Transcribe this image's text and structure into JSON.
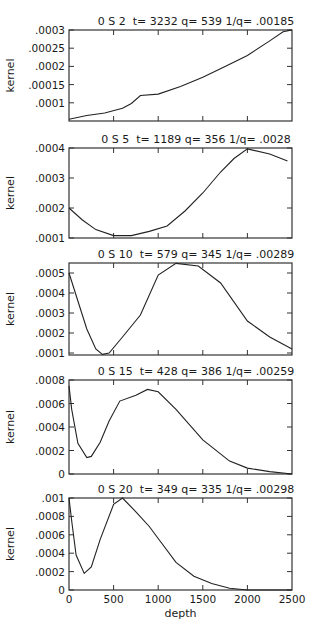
{
  "figure": {
    "xlabel": "depth",
    "ylabel": "kernel"
  },
  "chart_data": [
    {
      "type": "line",
      "title": "0 S 2   t= 3232 q= 539 1/q= .00185",
      "xlabel": "",
      "ylabel": "kernel",
      "xlim": [
        0,
        2500
      ],
      "ylim": [
        5e-05,
        0.0003
      ],
      "yticks": [
        ".0001",
        ".00015",
        ".0002",
        ".00025",
        ".0003"
      ],
      "x": [
        0,
        200,
        400,
        600,
        700,
        800,
        1000,
        1250,
        1500,
        1750,
        2000,
        2250,
        2400,
        2500
      ],
      "values": [
        5.5e-05,
        6.5e-05,
        7.2e-05,
        8.5e-05,
        9.8e-05,
        0.00012,
        0.000124,
        0.000145,
        0.00017,
        0.0002,
        0.00023,
        0.00027,
        0.000295,
        0.0003
      ]
    },
    {
      "type": "line",
      "title": "0 S 5   t= 1189 q= 356 1/q= .0028",
      "xlabel": "",
      "ylabel": "kernel",
      "xlim": [
        0,
        2500
      ],
      "ylim": [
        0.0001,
        0.0004
      ],
      "yticks": [
        ".0001",
        ".0002",
        ".0003",
        ".0004"
      ],
      "x": [
        0,
        150,
        300,
        500,
        700,
        900,
        1100,
        1300,
        1500,
        1700,
        1850,
        2000,
        2250,
        2450
      ],
      "values": [
        0.0002,
        0.00016,
        0.000128,
        0.000108,
        0.000108,
        0.000122,
        0.00014,
        0.00019,
        0.00025,
        0.00032,
        0.000365,
        0.000397,
        0.00038,
        0.000357
      ]
    },
    {
      "type": "line",
      "title": "0 S 10   t= 579 q= 345 1/q= .00289",
      "xlabel": "",
      "ylabel": "kernel",
      "xlim": [
        0,
        2500
      ],
      "ylim": [
        9e-05,
        0.00055
      ],
      "yticks": [
        ".0001",
        ".0002",
        ".0003",
        ".0004",
        ".0005"
      ],
      "x": [
        0,
        100,
        200,
        300,
        375,
        450,
        600,
        800,
        1000,
        1200,
        1450,
        1700,
        2000,
        2250,
        2500
      ],
      "values": [
        0.0005,
        0.00036,
        0.00022,
        0.00012,
        9.3e-05,
        0.0001,
        0.00018,
        0.00029,
        0.00049,
        0.000548,
        0.000535,
        0.00045,
        0.00026,
        0.00018,
        0.00012
      ]
    },
    {
      "type": "line",
      "title": "0 S 15   t= 428 q= 386 1/q= .00259",
      "xlabel": "",
      "ylabel": "kernel",
      "xlim": [
        0,
        2500
      ],
      "ylim": [
        0,
        0.0008
      ],
      "yticks": [
        "0",
        ".0002",
        ".0004",
        ".0006",
        ".0008"
      ],
      "x": [
        0,
        30,
        100,
        200,
        250,
        350,
        450,
        570,
        750,
        880,
        1000,
        1200,
        1500,
        1800,
        2000,
        2250,
        2500
      ],
      "values": [
        0.00075,
        0.00055,
        0.00026,
        0.00014,
        0.00015,
        0.00027,
        0.00045,
        0.00062,
        0.00067,
        0.00072,
        0.0007,
        0.00055,
        0.00029,
        0.00011,
        5e-05,
        2e-05,
        0
      ]
    },
    {
      "type": "line",
      "title": "0 S 20   t= 349 q= 335 1/q= .00298",
      "xlabel": "depth",
      "ylabel": "kernel",
      "xlim": [
        0,
        2500
      ],
      "xticks": [
        "0",
        "500",
        "1000",
        "1500",
        "2000",
        "2500"
      ],
      "ylim": [
        0,
        0.001
      ],
      "yticks": [
        "0",
        ".0002",
        ".0004",
        ".0006",
        ".0008",
        ".001"
      ],
      "x": [
        0,
        30,
        80,
        170,
        250,
        350,
        500,
        600,
        750,
        900,
        1000,
        1200,
        1400,
        1600,
        1800,
        2000,
        2250,
        2500
      ],
      "values": [
        0.001,
        0.00075,
        0.00038,
        0.00018,
        0.00025,
        0.00055,
        0.00093,
        0.001,
        0.00085,
        0.00069,
        0.00056,
        0.0003,
        0.00015,
        7e-05,
        2e-05,
        0,
        0,
        0
      ]
    }
  ]
}
